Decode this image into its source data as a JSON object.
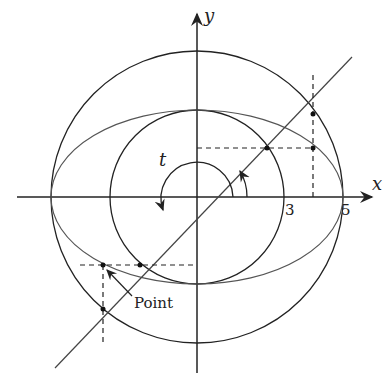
{
  "diagram": {
    "axes": {
      "x_label": "x",
      "y_label": "y"
    },
    "ticks": [
      {
        "label": "3"
      },
      {
        "label": "5"
      }
    ],
    "angle_label": "t",
    "annotation": "Point",
    "shapes": {
      "outer_circle_radius": 5,
      "inner_circle_radius": 3,
      "ellipse": {
        "a": 5,
        "b": 3
      }
    },
    "colors": {
      "stroke": "#222222",
      "ellipse": "#555555"
    }
  }
}
